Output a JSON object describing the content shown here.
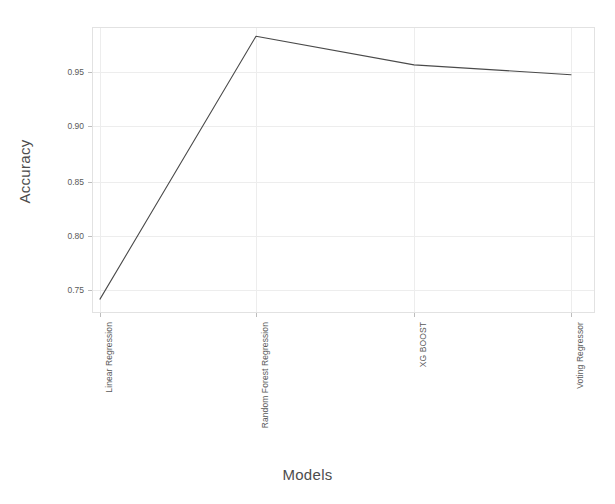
{
  "chart_data": {
    "type": "line",
    "title": "",
    "xlabel": "Models",
    "ylabel": "Accuracy",
    "categories": [
      "Linear Regression",
      "Random Forest Regression",
      "XG BOOST",
      "Voting Regressor"
    ],
    "values": [
      0.739,
      0.978,
      0.952,
      0.943
    ],
    "series": [
      {
        "name": "Accuracy",
        "values": [
          0.739,
          0.978,
          0.952,
          0.943
        ]
      }
    ],
    "ylim": [
      0.7255,
      0.9855
    ],
    "yticks": [
      "0.75",
      "0.80",
      "0.85",
      "0.90",
      "0.95"
    ],
    "ytick_values": [
      0.75,
      0.8,
      0.85,
      0.9,
      0.95
    ],
    "grid": true,
    "legend": "none",
    "line_color": "#4a4a4a",
    "grid_color": "#ededed",
    "background_color": "#ffffff"
  },
  "axes": {
    "x_title": "Models",
    "y_title": "Accuracy",
    "x_labels": [
      "Linear Regression",
      "Random Forest Regression",
      "XG BOOST",
      "Voting Regressor"
    ],
    "y_labels": [
      "0.95",
      "0.90",
      "0.85",
      "0.80",
      "0.75"
    ]
  }
}
